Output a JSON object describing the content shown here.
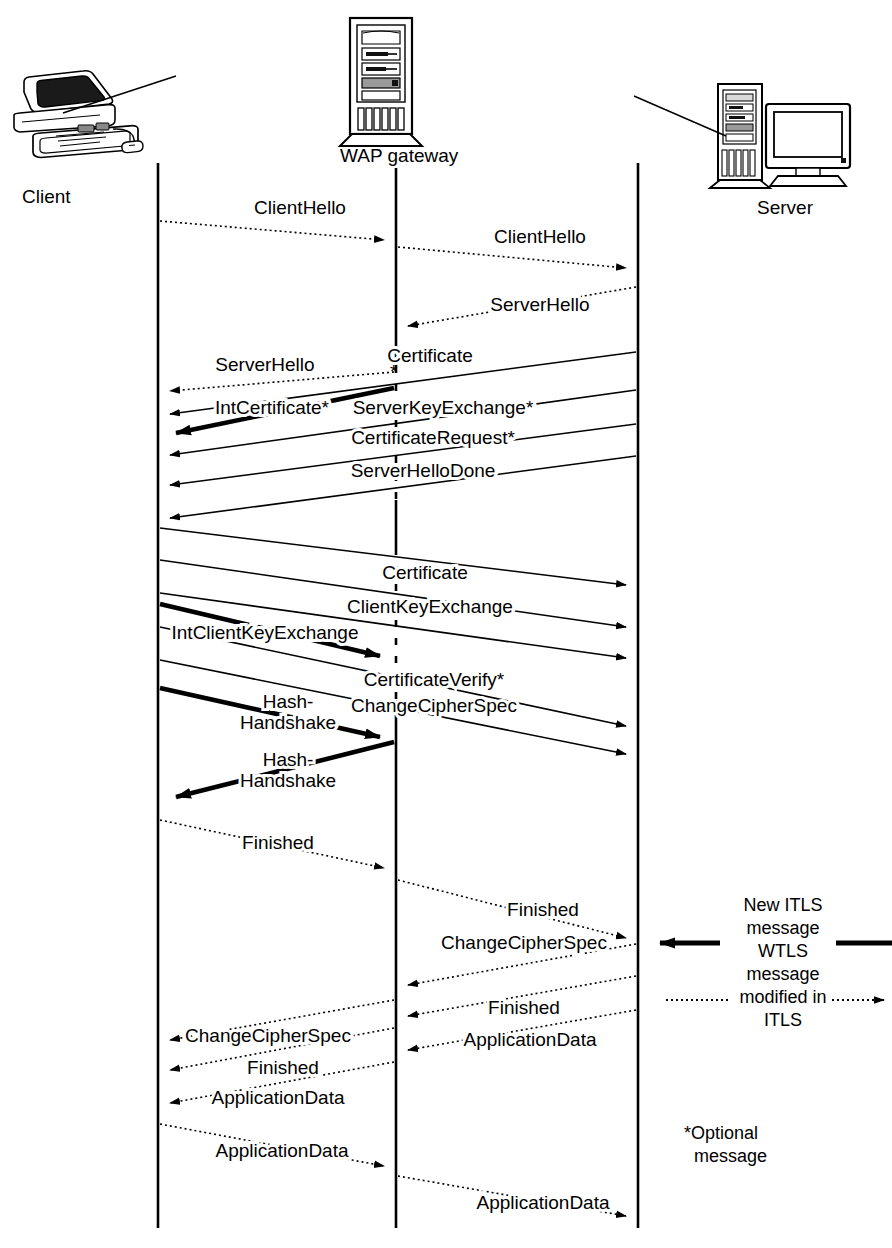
{
  "diagram": {
    "type": "sequence-diagram",
    "colors": {
      "stroke": "#000000",
      "background": "#ffffff"
    },
    "actors": [
      {
        "id": "client",
        "label": "Client",
        "icon": "desktop-computer-icon",
        "lifeline_x": 158
      },
      {
        "id": "gateway",
        "label": "WAP gateway",
        "icon": "server-tower-icon",
        "lifeline_x": 396
      },
      {
        "id": "server",
        "label": "Server",
        "icon": "server-with-monitor-icon",
        "lifeline_x": 638
      }
    ],
    "messages": [
      {
        "id": "m01",
        "label": "ClientHello",
        "from": "client",
        "to": "gateway",
        "style": "dotted",
        "weight": "thin",
        "y_start": 221,
        "y_end": 240,
        "label_x": 300,
        "label_y": 214
      },
      {
        "id": "m02",
        "label": "ClientHello",
        "from": "gateway",
        "to": "server",
        "style": "dotted",
        "weight": "thin",
        "y_start": 247,
        "y_end": 268,
        "label_x": 540,
        "label_y": 243
      },
      {
        "id": "m03",
        "label": "ServerHello",
        "from": "server",
        "to": "gateway",
        "style": "dotted",
        "weight": "thin",
        "y_start": 287,
        "y_end": 326,
        "label_x": 540,
        "label_y": 311
      },
      {
        "id": "m04",
        "label": "ServerHello",
        "from": "gateway",
        "to": "client",
        "style": "dotted",
        "weight": "thin",
        "y_start": 372,
        "y_end": 391,
        "label_x": 265,
        "label_y": 371
      },
      {
        "id": "m05",
        "label": "Certificate",
        "from": "server",
        "to": "client",
        "style": "solid",
        "weight": "thin",
        "y_start": 352,
        "y_end": 414,
        "label_x": 430,
        "label_y": 358
      },
      {
        "id": "m06",
        "label": "IntCertificate*",
        "from": "gateway",
        "to": "client",
        "style": "solid",
        "weight": "bold",
        "y_start": 388,
        "y_end": 433,
        "label_x": 207,
        "label_y": 409
      },
      {
        "id": "m07",
        "label": "ServerKeyExchange*",
        "from": "server",
        "to": "client",
        "style": "solid",
        "weight": "thin",
        "y_start": 390,
        "y_end": 455,
        "label_x": 435,
        "label_y": 409
      },
      {
        "id": "m08",
        "label": "CertificateRequest*",
        "from": "server",
        "to": "client",
        "style": "solid",
        "weight": "thin",
        "y_start": 424,
        "y_end": 485,
        "label_x": 433,
        "label_y": 440
      },
      {
        "id": "m09",
        "label": "ServerHelloDone",
        "from": "server",
        "to": "client",
        "style": "solid",
        "weight": "thin",
        "y_start": 456,
        "y_end": 518,
        "label_x": 420,
        "label_y": 473
      },
      {
        "id": "m10",
        "label": "Certificate",
        "from": "client",
        "to": "server",
        "style": "solid",
        "weight": "thin",
        "y_start": 528,
        "y_end": 585,
        "label_x": 422,
        "label_y": 575
      },
      {
        "id": "m11",
        "label": "ClientKeyExchange",
        "from": "client",
        "to": "server",
        "style": "solid",
        "weight": "thin",
        "y_start": 560,
        "y_end": 627,
        "label_x": 427,
        "label_y": 609
      },
      {
        "id": "m12",
        "label": "IntClientKeyExchange",
        "from": "client",
        "to": "gateway",
        "style": "solid",
        "weight": "bold",
        "y_start": 604,
        "y_end": 656,
        "label_x": 258,
        "label_y": 632
      },
      {
        "id": "m13",
        "label": "CertificateVerify*",
        "from": "client",
        "to": "server",
        "style": "solid",
        "weight": "thin",
        "y_start": 627,
        "y_end": 658,
        "label_x": 432,
        "label_y": 681
      },
      {
        "id": "m14",
        "label": "ChangeCipherSpec",
        "from": "client",
        "to": "server",
        "style": "solid",
        "weight": "thin",
        "y_start": 660,
        "y_end": 726,
        "label_x": 431,
        "label_y": 707
      },
      {
        "id": "m15",
        "label": "Hash-Handshake",
        "from": "client",
        "to": "gateway",
        "style": "solid",
        "weight": "bold",
        "y_start": 688,
        "y_end": 736,
        "label_x": 283,
        "label_y": 707
      },
      {
        "id": "m16",
        "label": "Hash-Handshake",
        "from": "gateway",
        "to": "client",
        "style": "solid",
        "weight": "bold",
        "y_start": 742,
        "y_end": 793,
        "label_x": 283,
        "label_y": 765
      },
      {
        "id": "m17",
        "label": "Finished",
        "from": "client",
        "to": "gateway",
        "style": "dotted",
        "weight": "thin",
        "y_start": 820,
        "y_end": 868,
        "label_x": 275,
        "label_y": 844
      },
      {
        "id": "m18",
        "label": "Finished",
        "from": "gateway",
        "to": "server",
        "style": "dotted",
        "weight": "thin",
        "y_start": 880,
        "y_end": 938,
        "label_x": 540,
        "label_y": 911
      },
      {
        "id": "m19",
        "label": "ChangeCipherSpec",
        "from": "server",
        "to": "gateway",
        "style": "dotted",
        "weight": "thin",
        "y_start": 944,
        "y_end": 985,
        "label_x": 520,
        "label_y": 944
      },
      {
        "id": "m20",
        "label": "Finished",
        "from": "server",
        "to": "gateway",
        "style": "dotted",
        "weight": "thin",
        "y_start": 976,
        "y_end": 1016,
        "label_x": 520,
        "label_y": 1009
      },
      {
        "id": "m21",
        "label": "ApplicationData",
        "from": "server",
        "to": "gateway",
        "style": "dotted",
        "weight": "thin",
        "y_start": 1010,
        "y_end": 1044,
        "label_x": 525,
        "label_y": 1040
      },
      {
        "id": "m22",
        "label": "ChangeCipherSpec",
        "from": "gateway",
        "to": "client",
        "style": "dotted",
        "weight": "thin",
        "y_start": 1000,
        "y_end": 1040,
        "label_x": 265,
        "label_y": 1036
      },
      {
        "id": "m23",
        "label": "Finished",
        "from": "gateway",
        "to": "client",
        "style": "dotted",
        "weight": "thin",
        "y_start": 1028,
        "y_end": 1070,
        "label_x": 280,
        "label_y": 1068
      },
      {
        "id": "m24",
        "label": "ApplicationData",
        "from": "gateway",
        "to": "client",
        "style": "dotted",
        "weight": "thin",
        "y_start": 1062,
        "y_end": 1100,
        "label_x": 275,
        "label_y": 1097
      },
      {
        "id": "m25",
        "label": "ApplicationData",
        "from": "client",
        "to": "gateway",
        "style": "dotted",
        "weight": "thin",
        "y_start": 1124,
        "y_end": 1163,
        "label_x": 278,
        "label_y": 1151
      },
      {
        "id": "m26",
        "label": "ApplicationData",
        "from": "gateway",
        "to": "server",
        "style": "dotted",
        "weight": "thin",
        "y_start": 1176,
        "y_end": 1213,
        "label_x": 540,
        "label_y": 1203
      }
    ],
    "asterisk_marker": "*",
    "legend": {
      "lines": [
        "New ITLS",
        "message",
        "WTLS",
        "message",
        "modified in",
        "ITLS"
      ],
      "left_solid_arrow": "bold-left-arrow",
      "right_solid_arrow": "bold-right-line",
      "left_dotted_arrow": "dotted-left-line",
      "right_dotted_arrow": "dotted-right-arrow"
    },
    "footnote": {
      "line1": "*Optional",
      "line2": "message"
    }
  }
}
